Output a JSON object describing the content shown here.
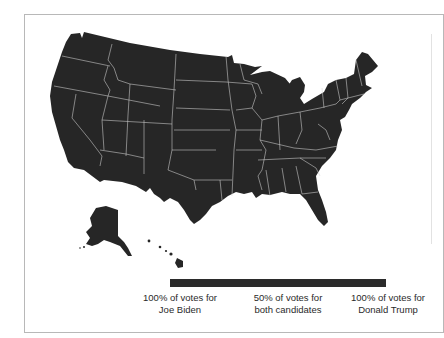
{
  "map": {
    "title": "",
    "region": "United States (by state)",
    "fill_color": "#262626",
    "border_color": "#d8d8d8",
    "insets": [
      "Alaska",
      "Hawaii"
    ]
  },
  "legend": {
    "bar_color": "#2b2b2b",
    "labels": [
      {
        "line1": "100% of votes for",
        "line2": "Joe Biden"
      },
      {
        "line1": "50% of votes for",
        "line2": "both candidates"
      },
      {
        "line1": "100% of votes for",
        "line2": "Donald Trump"
      }
    ]
  }
}
